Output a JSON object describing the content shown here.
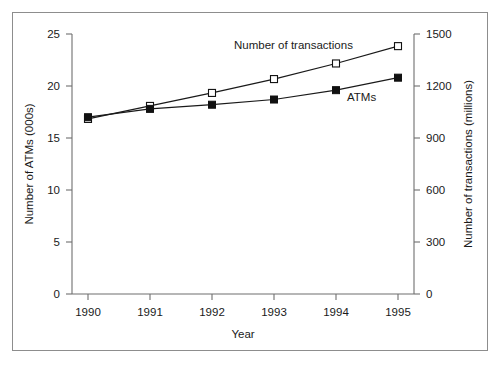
{
  "chart_data": {
    "type": "line",
    "title": "",
    "xlabel": "Year",
    "categories": [
      "1990",
      "1991",
      "1992",
      "1993",
      "1994",
      "1995"
    ],
    "grid": false,
    "legend_position": "inline-annotation",
    "axes": {
      "left": {
        "label": "Number of ATMs (000s)",
        "ticks": [
          "0",
          "5",
          "10",
          "15",
          "20",
          "25"
        ],
        "tick_values": [
          0,
          5,
          10,
          15,
          20,
          25
        ],
        "ylim": [
          0,
          25
        ]
      },
      "right": {
        "label": "Number of transactions (millions)",
        "ticks": [
          "0",
          "300",
          "600",
          "900",
          "1200",
          "1500"
        ],
        "tick_values": [
          0,
          300,
          600,
          900,
          1200,
          1500
        ],
        "ylim": [
          0,
          1500
        ]
      },
      "x": {
        "label": "Year",
        "ticks": [
          "1990",
          "1991",
          "1992",
          "1993",
          "1994",
          "1995"
        ]
      }
    },
    "series": [
      {
        "name": "ATMs",
        "annotation": "ATMs",
        "axis": "left",
        "marker": "filled-square",
        "values": [
          17.0,
          17.8,
          18.2,
          18.7,
          19.6,
          20.8
        ]
      },
      {
        "name": "Number of transactions",
        "annotation": "Number of transactions",
        "axis": "right",
        "marker": "open-square",
        "values": [
          1010,
          1085,
          1160,
          1240,
          1330,
          1430
        ]
      }
    ],
    "colors": {
      "line": "#1a1a1a",
      "axis": "#6f6f6f",
      "frame": "#8d8d8d",
      "background": "#ffffff"
    }
  },
  "annotations": {
    "transactions_label": "Number of transactions",
    "atms_label": "ATMs"
  }
}
